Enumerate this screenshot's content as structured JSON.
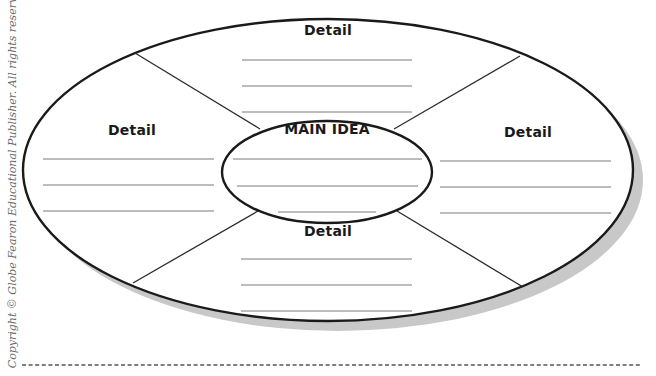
{
  "diagram": {
    "type": "main-idea-detail-web",
    "copyright": "Copyright © Globe Fearon Educational Publisher. All rights reserved.",
    "main_idea": {
      "label": "MAIN IDEA",
      "blank_lines": 3
    },
    "details": [
      {
        "position": "top",
        "label": "Detail",
        "blank_lines": 3
      },
      {
        "position": "left",
        "label": "Detail",
        "blank_lines": 3
      },
      {
        "position": "right",
        "label": "Detail",
        "blank_lines": 3
      },
      {
        "position": "bottom",
        "label": "Detail",
        "blank_lines": 3
      }
    ],
    "colors": {
      "outline": "#1a1a1a",
      "writing_line": "#7a7a7a",
      "shadow": "#c8c8c8",
      "copyright_text": "#6a6a6a",
      "cut_line": "#555555"
    },
    "footer": {
      "cut_line": "dashed"
    }
  }
}
